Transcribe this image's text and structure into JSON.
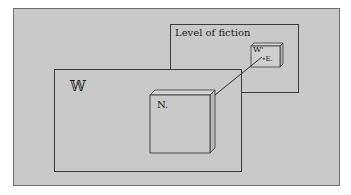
{
  "diagram": {
    "background_color": "#c9c9c9",
    "line_color": "#3a3a3a",
    "outer_frame": {
      "x": 13,
      "y": 8,
      "w": 327,
      "h": 178
    },
    "fiction_box": {
      "label": "Level of fiction",
      "x": 170,
      "y": 24,
      "w": 128,
      "h": 68
    },
    "world_box": {
      "label": "𝕎",
      "x": 54,
      "y": 69,
      "w": 187,
      "h": 102
    },
    "n_box": {
      "label": "N.",
      "x": 150,
      "y": 95,
      "w": 60,
      "h": 58,
      "depth": 5
    },
    "w_prime_box": {
      "label": "W'",
      "sub_label": "∘E.",
      "x": 251,
      "y": 46,
      "w": 29,
      "h": 21,
      "depth": 3
    },
    "connector": {
      "x1": 215,
      "y1": 95,
      "x2": 262,
      "y2": 57
    }
  }
}
